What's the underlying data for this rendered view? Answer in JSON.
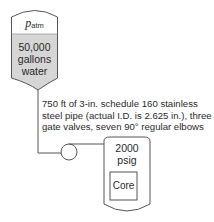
{
  "tank": {
    "pressure_symbol": "p",
    "pressure_subscript": "atm",
    "volume_line1": "50,000",
    "volume_line2": "gallons",
    "volume_line3": "water",
    "fill_color": "#d6d6d6"
  },
  "pipe": {
    "description": "750 ft of 3-in. schedule 160 stainless steel pipe (actual I.D. is 2.625 in.), three gate valves, seven 90° regular elbows"
  },
  "pump": {
    "symbol": "circle"
  },
  "vessel": {
    "pressure_value": "2000",
    "pressure_unit": "psig",
    "core_label": "Core"
  },
  "colors": {
    "line": "#555555",
    "water": "#d6d6d6"
  }
}
